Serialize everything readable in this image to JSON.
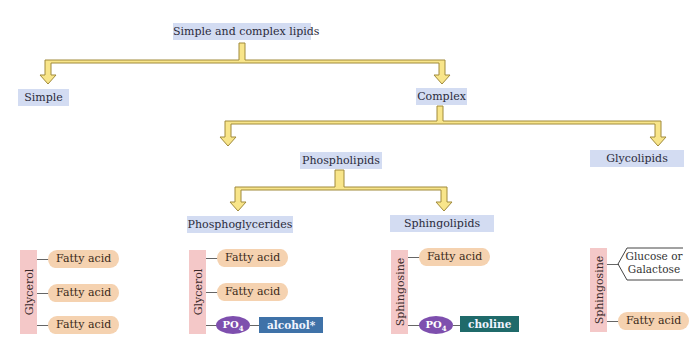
{
  "diagram": {
    "title": "Simple and complex lipids",
    "nodes": {
      "root": "Simple and complex lipids",
      "simple": "Simple",
      "complex": "Complex",
      "phospholipids": "Phospholipids",
      "glycolipids": "Glycolipids",
      "phosphoglycerides": "Phosphoglycerides",
      "sphingolipids": "Sphingolipids"
    },
    "edges": [
      [
        "Simple and complex lipids",
        "Simple"
      ],
      [
        "Simple and complex lipids",
        "Complex"
      ],
      [
        "Complex",
        "Phospholipids"
      ],
      [
        "Complex",
        "Glycolipids"
      ],
      [
        "Phospholipids",
        "Phosphoglycerides"
      ],
      [
        "Phospholipids",
        "Sphingolipids"
      ]
    ],
    "structures": {
      "triacylglycerol": {
        "backbone": "Glycerol",
        "groups": [
          "Fatty acid",
          "Fatty acid",
          "Fatty acid"
        ]
      },
      "phosphoglyceride": {
        "backbone": "Glycerol",
        "groups": [
          "Fatty acid",
          "Fatty acid"
        ],
        "phosphate": "PO",
        "phosphate_sub": "4",
        "head": "alcohol*"
      },
      "sphingolipid": {
        "backbone": "Sphingosine",
        "groups": [
          "Fatty acid"
        ],
        "phosphate": "PO",
        "phosphate_sub": "4",
        "head": "choline"
      },
      "glycolipid": {
        "backbone": "Sphingosine",
        "sugar_line1": "Glucose or",
        "sugar_line2": "Galactose",
        "groups": [
          "Fatty acid"
        ]
      }
    },
    "colors": {
      "node_bg": "#d3dcf2",
      "arrow_fill": "#f8e58a",
      "arrow_stroke": "#a08a3a",
      "backbone": "#f4c8c8",
      "fatty_acid": "#f5d2b0",
      "phosphate": "#7e4fae",
      "alcohol": "#3f72a8",
      "choline": "#1f6a6a"
    }
  }
}
